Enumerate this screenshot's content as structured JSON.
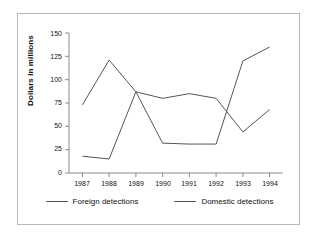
{
  "chart_data": {
    "type": "line",
    "title": "",
    "xlabel": "",
    "ylabel": "Dollars in millions",
    "categories": [
      "1987",
      "1988",
      "1989",
      "1990",
      "1991",
      "1992",
      "1993",
      "1994"
    ],
    "ylim": [
      0,
      150
    ],
    "yticks": [
      0,
      25,
      50,
      75,
      100,
      125,
      150
    ],
    "ytick_labels": [
      "0",
      "25",
      "50",
      "75",
      "100",
      "125",
      "150"
    ],
    "grid": false,
    "legend_position": "bottom",
    "series": [
      {
        "name": "Foreign detections",
        "color": "#555555",
        "values": [
          18,
          15,
          87,
          32,
          31,
          31,
          120,
          135
        ]
      },
      {
        "name": "Domestic detections",
        "color": "#555555",
        "values": [
          73,
          121,
          87,
          80,
          85,
          80,
          44,
          68
        ]
      }
    ]
  },
  "axis": {
    "y_title": "Dollars in millions"
  },
  "legend": {
    "entries": [
      {
        "label": "Foreign detections"
      },
      {
        "label": "Domestic detections"
      }
    ]
  }
}
